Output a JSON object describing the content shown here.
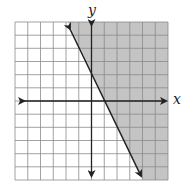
{
  "graph": {
    "type": "linear-inequality",
    "x_axis_label": "x",
    "y_axis_label": "y",
    "grid": {
      "x_min": -6,
      "x_max": 6,
      "y_min": -6,
      "y_max": 6,
      "step": 1
    },
    "boundary_line": {
      "slope": -2,
      "y_intercept": 2,
      "style": "solid"
    },
    "shaded_side": "right/above",
    "colors": {
      "shade": "#c4c4c4",
      "grid": "#8a8a8a",
      "axis": "#222222",
      "line": "#222222"
    }
  }
}
